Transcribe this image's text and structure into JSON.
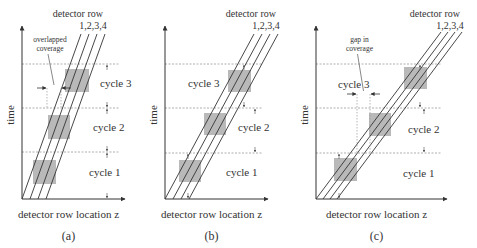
{
  "colors": {
    "line": "#333333",
    "dash": "#9a9a9a",
    "box": "#b9b9b9",
    "text": "#333333"
  },
  "panels": [
    {
      "id": "a",
      "caption": "(a)",
      "ylabel": "time",
      "xlabel": "detector row location z",
      "rows_label": "detector row",
      "rows_numbers": "1,2,3,4",
      "note": [
        "overlapped",
        "coverage"
      ],
      "ox": 22,
      "oy": 199,
      "xend": 125,
      "ytop": 26,
      "dash_y": [
        64,
        108,
        152
      ],
      "lines": [
        [
          22,
          199,
          81,
          34
        ],
        [
          30,
          199,
          89,
          34
        ],
        [
          38,
          199,
          97,
          34
        ],
        [
          46,
          199,
          105,
          34
        ]
      ],
      "boxes": [
        [
          33,
          160,
          23,
          24
        ],
        [
          48,
          115,
          22,
          24
        ],
        [
          65,
          69,
          24,
          23
        ]
      ],
      "cycles": [
        {
          "label": "cycle 1",
          "x": 89,
          "y": 176
        },
        {
          "label": "cycle 2",
          "x": 93,
          "y": 131
        },
        {
          "label": "cycle 3",
          "x": 100,
          "y": 87
        }
      ],
      "tick_x": 107,
      "coverage": {
        "left_x": 47,
        "right_x": 61,
        "arrow_y": 88,
        "dash_top": 88,
        "dash_bottom": 108,
        "mode": "overlap"
      }
    },
    {
      "id": "b",
      "caption": "(b)",
      "ylabel": "time",
      "xlabel": "detector row location z",
      "rows_label": "detector row",
      "rows_numbers": "1,2,3,4",
      "note": null,
      "ox": 165,
      "oy": 199,
      "xend": 268,
      "ytop": 26,
      "dash_y": [
        64,
        108,
        153
      ],
      "lines": [
        [
          165,
          199,
          254,
          34
        ],
        [
          173,
          199,
          262,
          34
        ],
        [
          181,
          199,
          270,
          34
        ],
        [
          189,
          199,
          278,
          34
        ]
      ],
      "boxes": [
        [
          179,
          160,
          22,
          22
        ],
        [
          204,
          113,
          22,
          22
        ],
        [
          228,
          70,
          23,
          22
        ]
      ],
      "cycles": [
        {
          "label": "cycle 1",
          "x": 226,
          "y": 176
        },
        {
          "label": "cycle 2",
          "x": 238,
          "y": 131
        },
        {
          "label": "cycle 3",
          "x": 188,
          "y": 87
        }
      ],
      "tick_x_list": [
        188,
        255,
        244
      ],
      "coverage": null
    },
    {
      "id": "c",
      "caption": "(c)",
      "ylabel": "time",
      "xlabel": "detector row location z",
      "rows_label": "detector row",
      "rows_numbers": "1,2,3,4",
      "note": [
        "gap in",
        "coverage"
      ],
      "ox": 316,
      "oy": 199,
      "xend": 447,
      "ytop": 26,
      "dash_y": [
        64,
        108,
        153
      ],
      "lines": [
        [
          316,
          199,
          441,
          32
        ],
        [
          323,
          199,
          448,
          32
        ],
        [
          330,
          199,
          455,
          32
        ],
        [
          337,
          199,
          462,
          32
        ]
      ],
      "boxes": [
        [
          334,
          158,
          23,
          23
        ],
        [
          369,
          113,
          22,
          23
        ],
        [
          404,
          67,
          23,
          22
        ]
      ],
      "cycles": [
        {
          "label": "cycle 1",
          "x": 403,
          "y": 177
        },
        {
          "label": "cycle 2",
          "x": 408,
          "y": 133
        },
        {
          "label": "cycle 3",
          "x": 338,
          "y": 88
        }
      ],
      "tick_x_list": [
        339,
        424,
        420
      ],
      "coverage": {
        "left_x": 357,
        "right_x": 370,
        "arrow_y": 94,
        "dash_top": 94,
        "dash_bottom": 153,
        "mode": "gap"
      }
    }
  ]
}
